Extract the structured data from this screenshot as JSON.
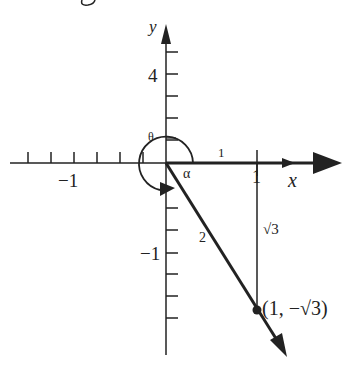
{
  "figure": {
    "top_fragment": "g",
    "axes": {
      "x_label": "x",
      "y_label": "y",
      "x_tick_label_neg": "−1",
      "x_tick_label_pos": "1",
      "y_tick_label_pos": "4",
      "y_tick_label_neg": "−1"
    },
    "angles": {
      "theta": "θ",
      "alpha": "α"
    },
    "segments": {
      "horizontal_length": "1",
      "hypotenuse_length": "2",
      "vertical_length": "√3"
    },
    "point": {
      "label": "(1, −√3)"
    },
    "colors": {
      "ink": "#222222",
      "background": "#ffffff"
    }
  }
}
